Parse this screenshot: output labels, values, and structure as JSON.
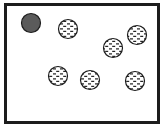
{
  "figure": {
    "canvas": {
      "width": 168,
      "height": 134,
      "background": "#ffffff"
    },
    "frame": {
      "name": "container-box",
      "x": 4,
      "y": 3,
      "width": 156,
      "height": 121,
      "stroke": "#1d1d1d",
      "stroke_width": 3,
      "fill": "#ffffff"
    },
    "legend_colors": {
      "solid_fill": "#5b5b5b",
      "hatched_fill": "#ffffff",
      "outline": "#1d1d1d",
      "hatch_stroke": "#262626"
    }
  },
  "chart_data": {
    "type": "scatter",
    "title": "",
    "xlabel": "",
    "ylabel": "",
    "xlim": [
      0,
      168
    ],
    "ylim": [
      0,
      134
    ],
    "grid": false,
    "legend": null,
    "series": [
      {
        "name": "solid-particle",
        "style": "solid",
        "fill": "#5b5b5b",
        "count": 1,
        "points": [
          {
            "id": "p1",
            "x": 31,
            "y": 23,
            "r": 9.5
          }
        ]
      },
      {
        "name": "hatched-particle",
        "style": "dashed-hatch",
        "fill": "#ffffff",
        "count": 6,
        "points": [
          {
            "id": "p2",
            "x": 68,
            "y": 29,
            "r": 9.5
          },
          {
            "id": "p3",
            "x": 137,
            "y": 35,
            "r": 9.5
          },
          {
            "id": "p4",
            "x": 113,
            "y": 48,
            "r": 9.5
          },
          {
            "id": "p5",
            "x": 58,
            "y": 76,
            "r": 9.5
          },
          {
            "id": "p6",
            "x": 90,
            "y": 80,
            "r": 9.5
          },
          {
            "id": "p7",
            "x": 135,
            "y": 81,
            "r": 9.5
          }
        ]
      }
    ],
    "totals": {
      "all_particles": 7,
      "solid": 1,
      "hatched": 6
    }
  }
}
